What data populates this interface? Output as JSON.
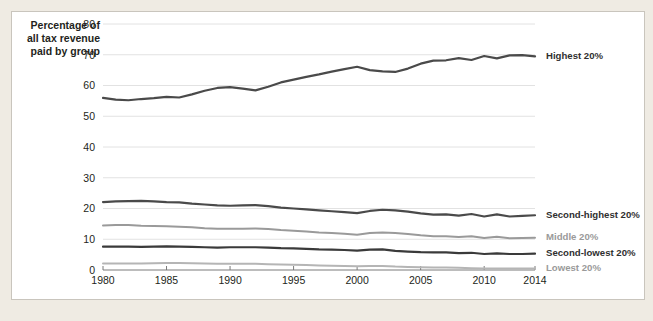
{
  "panel": {
    "background": "#ffffff",
    "border_color": "#c9c5bd",
    "page_background": "#efebe3"
  },
  "axis_caption": "Percentage of\nall tax revenue\npaid by group",
  "chart_data": {
    "type": "line",
    "title": "",
    "subtitle": "",
    "xlabel": "",
    "ylabel": "Percentage of all tax revenue paid by group",
    "xlim": [
      1980,
      2014
    ],
    "ylim": [
      0,
      80
    ],
    "ytick_labels": [
      "0",
      "10",
      "20",
      "30",
      "40",
      "50",
      "60",
      "70",
      "80"
    ],
    "yticks": [
      0,
      10,
      20,
      30,
      40,
      50,
      60,
      70,
      80
    ],
    "xtick_labels": [
      "1980",
      "1985",
      "1990",
      "1995",
      "2000",
      "2005",
      "2010",
      "2014"
    ],
    "xticks": [
      1980,
      1985,
      1990,
      1995,
      2000,
      2005,
      2010,
      2014
    ],
    "grid": true,
    "legend_position": "right-inline",
    "x": [
      1980,
      1981,
      1982,
      1983,
      1984,
      1985,
      1986,
      1987,
      1988,
      1989,
      1990,
      1991,
      1992,
      1993,
      1994,
      1995,
      1996,
      1997,
      1998,
      1999,
      2000,
      2001,
      2002,
      2003,
      2004,
      2005,
      2006,
      2007,
      2008,
      2009,
      2010,
      2011,
      2012,
      2013,
      2014
    ],
    "series": [
      {
        "name": "Highest 20%",
        "label": "Highest 20%",
        "color": "#4a4a4a",
        "width": 2.2,
        "label_color": "#2f2f2f",
        "values": [
          56.0,
          55.4,
          55.2,
          55.6,
          55.9,
          56.3,
          56.1,
          57.1,
          58.3,
          59.2,
          59.5,
          59.0,
          58.4,
          59.6,
          61.0,
          61.9,
          62.8,
          63.6,
          64.5,
          65.3,
          66.1,
          65.0,
          64.6,
          64.4,
          65.5,
          67.1,
          68.1,
          68.2,
          68.9,
          68.3,
          69.6,
          68.8,
          69.8,
          69.9,
          69.5
        ]
      },
      {
        "name": "Second-highest 20%",
        "label": "Second-highest 20%",
        "color": "#4a4a4a",
        "width": 2.2,
        "label_color": "#2f2f2f",
        "values": [
          22.1,
          22.3,
          22.4,
          22.5,
          22.3,
          22.1,
          22.0,
          21.6,
          21.3,
          21.0,
          20.9,
          21.0,
          21.1,
          20.8,
          20.3,
          20.0,
          19.7,
          19.4,
          19.1,
          18.8,
          18.5,
          19.2,
          19.6,
          19.4,
          19.0,
          18.4,
          18.0,
          18.1,
          17.7,
          18.2,
          17.4,
          18.1,
          17.4,
          17.6,
          17.8
        ]
      },
      {
        "name": "Middle 20%",
        "label": "Middle 20%",
        "color": "#9a9a9a",
        "width": 2.0,
        "label_color": "#9a9a9a",
        "values": [
          14.5,
          14.6,
          14.6,
          14.4,
          14.3,
          14.2,
          14.1,
          13.9,
          13.6,
          13.4,
          13.4,
          13.4,
          13.5,
          13.3,
          13.0,
          12.8,
          12.5,
          12.2,
          12.0,
          11.8,
          11.5,
          12.0,
          12.2,
          12.0,
          11.7,
          11.3,
          11.0,
          11.0,
          10.7,
          11.0,
          10.4,
          10.8,
          10.3,
          10.4,
          10.5
        ]
      },
      {
        "name": "Second-lowest 20%",
        "label": "Second-lowest 20%",
        "color": "#3a3a3a",
        "width": 2.2,
        "label_color": "#2f2f2f",
        "values": [
          7.6,
          7.6,
          7.6,
          7.5,
          7.6,
          7.7,
          7.6,
          7.5,
          7.4,
          7.3,
          7.4,
          7.4,
          7.4,
          7.3,
          7.1,
          7.0,
          6.9,
          6.7,
          6.6,
          6.5,
          6.3,
          6.6,
          6.7,
          6.2,
          6.0,
          5.8,
          5.7,
          5.7,
          5.5,
          5.6,
          5.2,
          5.4,
          5.2,
          5.2,
          5.3
        ]
      },
      {
        "name": "Lowest 20%",
        "label": "Lowest 20%",
        "color": "#b5b5b5",
        "width": 2.0,
        "label_color": "#9a9a9a",
        "values": [
          2.1,
          2.1,
          2.1,
          2.1,
          2.2,
          2.3,
          2.3,
          2.2,
          2.1,
          2.0,
          2.0,
          2.0,
          2.0,
          1.9,
          1.8,
          1.7,
          1.6,
          1.5,
          1.4,
          1.3,
          1.2,
          1.3,
          1.3,
          1.1,
          1.0,
          0.9,
          0.8,
          0.8,
          0.7,
          0.6,
          0.5,
          0.5,
          0.5,
          0.5,
          0.5
        ]
      }
    ]
  }
}
